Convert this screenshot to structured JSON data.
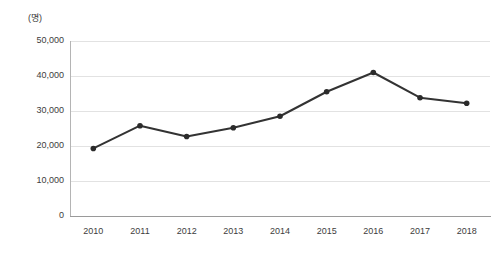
{
  "chart_data": {
    "type": "line",
    "title": "",
    "subtitle": "",
    "unit_label": "(명)",
    "xlabel": "",
    "ylabel": "",
    "categories": [
      "2010",
      "2011",
      "2012",
      "2013",
      "2014",
      "2015",
      "2016",
      "2017",
      "2018"
    ],
    "x": [
      2010,
      2011,
      2012,
      2013,
      2014,
      2015,
      2016,
      2017,
      2018
    ],
    "values": [
      19300,
      25800,
      22700,
      25200,
      28500,
      35500,
      41000,
      33800,
      32200
    ],
    "series": [
      {
        "name": "",
        "values": [
          19300,
          25800,
          22700,
          25200,
          28500,
          35500,
          41000,
          33800,
          32200
        ]
      }
    ],
    "ylim": [
      0,
      50000
    ],
    "ytick_values": [
      0,
      10000,
      20000,
      30000,
      40000,
      50000
    ],
    "ytick_labels": [
      "0",
      "10,000",
      "20,000",
      "30,000",
      "40,000",
      "50,000"
    ],
    "grid": true,
    "grid_axis": "y",
    "legend": false,
    "legend_position": "none",
    "marker": "circle",
    "line_color": "#333333",
    "marker_color": "#2b2b2b",
    "grid_color": "#e2e2e2",
    "axis_color": "#9a9a9a",
    "background_color": "#ffffff"
  }
}
